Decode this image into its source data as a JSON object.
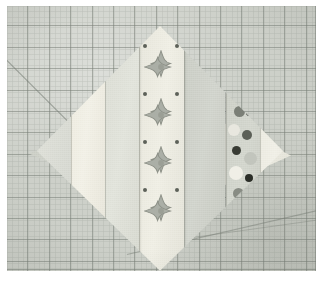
{
  "scene": {
    "title": "Quilt block laid on a cutting mat",
    "subject": "square-in-a-square quilt block on point",
    "surface": "self-healing rotary cutting mat"
  },
  "mat": {
    "name": "cutting-mat",
    "color": "#cdd0c9",
    "grid_line_color": "#787e76",
    "grid_spacing_px": 21.4,
    "minor_grid_spacing_px": 5.35,
    "guides": [
      {
        "name": "45-degree-guide",
        "angle_deg": 45,
        "location": "upper-left"
      },
      {
        "name": "shallow-guide",
        "angle_deg": -13,
        "location": "lower-right"
      },
      {
        "name": "shallow-guide-2",
        "angle_deg": -8,
        "location": "lower-right"
      }
    ]
  },
  "block": {
    "name": "quilt-block",
    "shape": "square on point (diamond)",
    "vertices": {
      "top": "50% 4.6%",
      "right": "97% 52.3%",
      "bottom": "50% 98%",
      "left": "3% 52.3%"
    },
    "strips": [
      {
        "id": "strip-1",
        "fabric": "solid-light-grey",
        "color": "#d4d6cf",
        "left_pct": 0,
        "width_pct": 16
      },
      {
        "id": "strip-2",
        "fabric": "cream-solid",
        "color": "#eceade",
        "left_pct": 16,
        "width_pct": 13
      },
      {
        "id": "strip-3",
        "fabric": "pale-tone",
        "color": "#d9dbd2",
        "left_pct": 29,
        "width_pct": 13
      },
      {
        "id": "strip-4",
        "fabric": "four-petal-motif",
        "color": "#e7e6db",
        "left_pct": 42,
        "width_pct": 17
      },
      {
        "id": "strip-5",
        "fabric": "mid-grey-solid",
        "color": "#c8cbc3",
        "left_pct": 59,
        "width_pct": 16
      },
      {
        "id": "strip-6",
        "fabric": "dot-print",
        "color": "#c9ccc3",
        "left_pct": 75,
        "width_pct": 13
      },
      {
        "id": "strip-7",
        "fabric": "off-white-solid",
        "color": "#e9e8de",
        "left_pct": 88,
        "width_pct": 12
      }
    ],
    "motif": {
      "name": "four-petal-flower",
      "count_in_center_strip": 4,
      "fill": "#9ba098",
      "outline": "#7d8279"
    },
    "corners": [
      {
        "id": "corner-left",
        "fabric": "dot-print",
        "color": "#c9ccc3"
      },
      {
        "id": "corner-right",
        "fabric": "four-petal-motif",
        "color": "#e7e6db"
      },
      {
        "id": "corner-top",
        "fabric": "mat-visible",
        "color": "#cdd0c9"
      },
      {
        "id": "corner-bottom",
        "fabric": "mat-visible",
        "color": "#cdd0c9"
      }
    ]
  },
  "palette": {
    "mat": "#cdd0c9",
    "grid": "#787e76",
    "cream": "#eceade",
    "light_grey": "#d4d6cf",
    "mid_grey": "#c8cbc3",
    "dot_dark": "#3f423c",
    "dot_white": "#f4f3ec",
    "motif_grey": "#9ba098",
    "frame": "#ffffff"
  }
}
